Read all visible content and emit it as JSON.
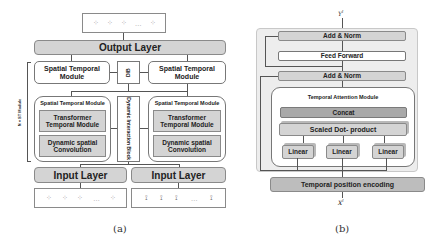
{
  "figure_a": {
    "caption": "(a)",
    "output_seq": {
      "items": [
        "⁘",
        "⁘",
        "⁘",
        "…",
        "⁘"
      ]
    },
    "output_layer": "Output Layer",
    "stack_label": "N × ST Module",
    "st_module_left": "Spatial Temporal Module",
    "st_module_right": "Spatial Temporal Module",
    "dib_small": "DIB",
    "dib_block": "Dynamic Interaction Block",
    "inner_left": {
      "title": "Spatial Temporal Module",
      "transformer": "Transformer Temporal Module",
      "dsc": "Dynamic spatial Convolution"
    },
    "inner_right": {
      "title": "Spatial Temporal Module",
      "transformer": "Transformer Temporal Module",
      "dsc": "Dynamic spatial Convolution"
    },
    "input_layer_left": "Input Layer",
    "input_layer_right": "Input Layer",
    "input_seq_left": {
      "items": [
        "⁘",
        "⁘",
        "⁘",
        "…",
        "⁘"
      ]
    },
    "input_seq_right": {
      "items": [
        "⟟",
        "⟟",
        "⟟",
        "…",
        "⟟"
      ]
    }
  },
  "figure_b": {
    "caption": "(b)",
    "output_symbol": "Y",
    "output_sup": "l",
    "input_symbol": "X",
    "input_sup": "l",
    "add_norm_top": "Add & Norm",
    "feed_forward": "Feed Forward",
    "add_norm_mid": "Add & Norm",
    "tam_title": "Temporal Attention Module",
    "concat": "Concat",
    "scaled_dot": "Scaled Dot- product",
    "linears": [
      "Linear",
      "Linear",
      "Linear"
    ],
    "temporal_pos_enc": "Temporal position encoding"
  },
  "colors": {
    "box_gray": "#d4d4d4",
    "concat_gray": "#a9a9a9",
    "container_bg": "#ededed",
    "border": "#8a8a8a"
  }
}
